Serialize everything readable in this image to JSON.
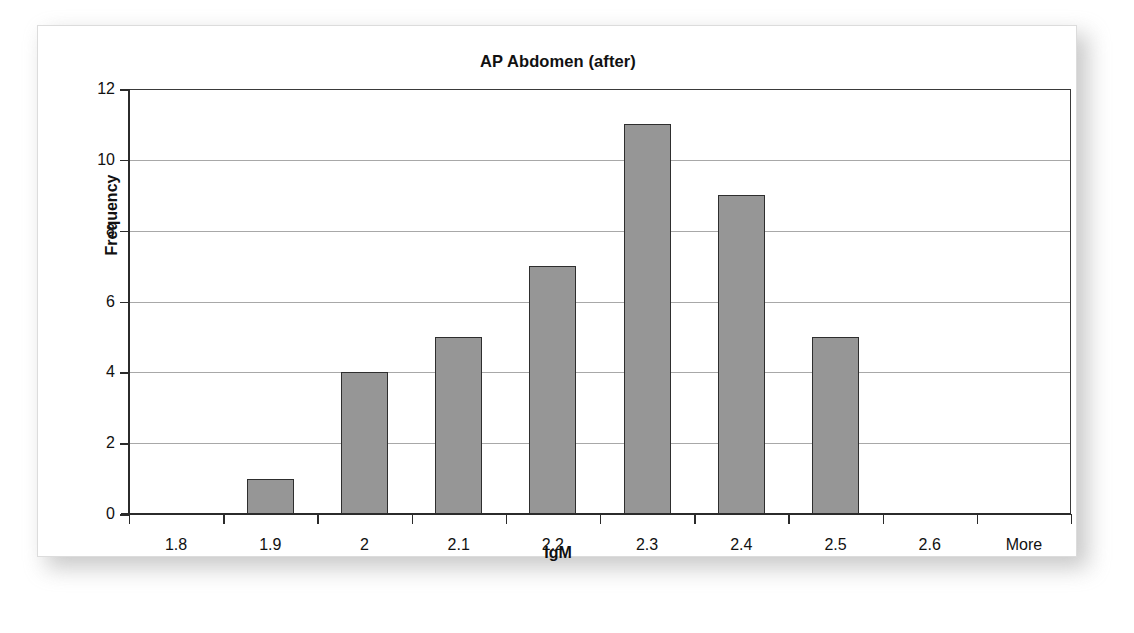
{
  "chart_data": {
    "type": "bar",
    "title": "AP Abdomen (after)",
    "xlabel": "IgM",
    "ylabel": "Frequency",
    "categories": [
      "1.8",
      "1.9",
      "2",
      "2.1",
      "2.2",
      "2.3",
      "2.4",
      "2.5",
      "2.6",
      "More"
    ],
    "values": [
      0,
      1,
      4,
      5,
      7,
      11,
      9,
      5,
      0,
      0
    ],
    "ylim": [
      0,
      12
    ],
    "yticks": [
      "12",
      "10",
      "8",
      "6",
      "4",
      "2",
      "0"
    ],
    "ytick_values": [
      12,
      10,
      8,
      6,
      4,
      2,
      0
    ],
    "grid": true,
    "legend": false,
    "bar_color": "#969696",
    "bar_border_color": "#2e2e2e",
    "gridline_color": "#a8a8a8",
    "axis_color": "#2b2b2b",
    "panel_background": "#ffffff",
    "text_color": "#111111"
  }
}
